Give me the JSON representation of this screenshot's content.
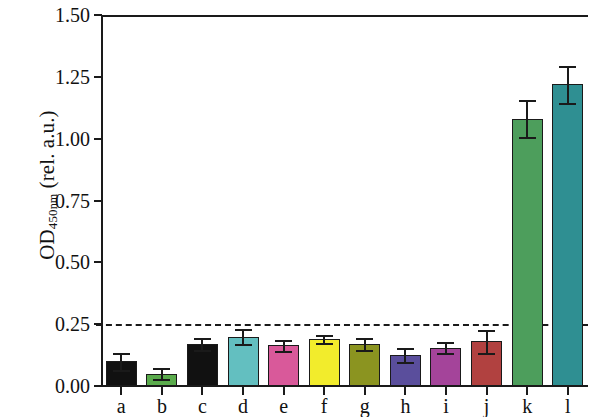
{
  "chart_data": {
    "type": "bar",
    "title": "",
    "xlabel": "",
    "ylabel": "OD450 nm (rel. a.u.)",
    "ylabel_base": "OD",
    "ylabel_sub": "450",
    "ylabel_subnm": "nm",
    "ylabel_rest": " (rel. a.u.)",
    "ylim": [
      0.0,
      1.5
    ],
    "yticks": [
      0.0,
      0.25,
      0.5,
      0.75,
      1.0,
      1.25,
      1.5
    ],
    "ytick_labels": [
      "0.00",
      "0.25",
      "0.50",
      "0.75",
      "1.00",
      "1.25",
      "1.50"
    ],
    "grid": false,
    "legend": "none",
    "categories": [
      "a",
      "b",
      "c",
      "d",
      "e",
      "f",
      "g",
      "h",
      "i",
      "j",
      "k",
      "l"
    ],
    "values": [
      0.1,
      0.05,
      0.17,
      0.2,
      0.165,
      0.19,
      0.17,
      0.125,
      0.155,
      0.18,
      1.08,
      1.22
    ],
    "errors": [
      0.035,
      0.022,
      0.025,
      0.03,
      0.022,
      0.018,
      0.025,
      0.028,
      0.022,
      0.045,
      0.075,
      0.075
    ],
    "bar_colors": [
      "#111111",
      "#5aab4c",
      "#111111",
      "#63bfc0",
      "#d9599a",
      "#f2ec2c",
      "#8b9420",
      "#5a4e9c",
      "#a4449a",
      "#b14140",
      "#4d9e5c",
      "#2f8f92"
    ],
    "annotations": [
      {
        "type": "threshold-line",
        "value": 0.25,
        "style": "dashed",
        "color": "#1a1a1a"
      }
    ]
  }
}
